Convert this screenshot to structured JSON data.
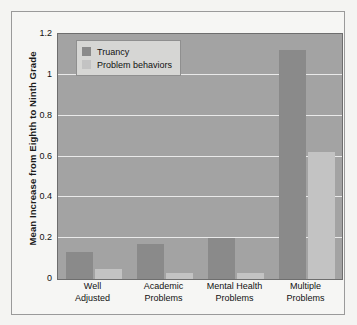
{
  "chart_data": {
    "type": "bar",
    "title": "",
    "xlabel": "",
    "ylabel": "Mean Increase from Eighth to Ninth Grade",
    "categories": [
      "Well Adjusted",
      "Academic Problems",
      "Mental Health Problems",
      "Multiple Problems"
    ],
    "category_lines": [
      [
        "Well",
        "Adjusted"
      ],
      [
        "Academic",
        "Problems"
      ],
      [
        "Mental Health",
        "Problems"
      ],
      [
        "Multiple",
        "Problems"
      ]
    ],
    "series": [
      {
        "name": "Truancy",
        "color": "#8a8a8a",
        "values": [
          0.13,
          0.17,
          0.2,
          1.12
        ]
      },
      {
        "name": "Problem behaviors",
        "color": "#c3c3c3",
        "values": [
          0.05,
          0.03,
          0.03,
          0.62
        ]
      }
    ],
    "ylim": [
      0,
      1.2
    ],
    "yticks": [
      "0",
      "0.2",
      "0.4",
      "0.6",
      "0.8",
      "1",
      "1.2"
    ],
    "ytick_values": [
      0,
      0.2,
      0.4,
      0.6,
      0.8,
      1,
      1.2
    ],
    "grid": true,
    "gridline_color": "#e9e9e9",
    "legend_position": "upper left",
    "plot_background": "#a3a3a3",
    "figure_background": "#f6f6f4"
  },
  "legend": {
    "items": [
      {
        "label": "Truancy"
      },
      {
        "label": "Problem behaviors"
      }
    ]
  }
}
